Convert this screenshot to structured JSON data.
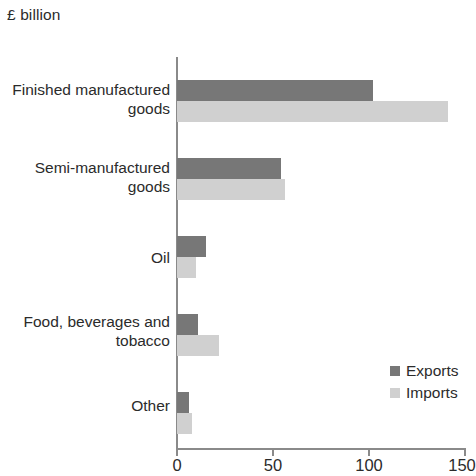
{
  "chart_data": {
    "type": "bar",
    "orientation": "horizontal",
    "title": "£ billion",
    "xlabel": "",
    "ylabel": "",
    "xlim": [
      0,
      150
    ],
    "xticks": [
      0,
      50,
      100,
      150
    ],
    "xtick_labels": [
      "0",
      "50",
      "100",
      "150"
    ],
    "grid": false,
    "legend_position": "inside-right-lower",
    "categories": [
      "Finished manufactured goods",
      "Semi-manufactured goods",
      "Oil",
      "Food, beverages and tobacco",
      "Other"
    ],
    "series": [
      {
        "name": "Exports",
        "color": "#777777",
        "values": [
          102,
          54,
          15,
          11,
          6
        ]
      },
      {
        "name": "Imports",
        "color": "#d0d0d0",
        "values": [
          141,
          56,
          10,
          22,
          8
        ]
      }
    ]
  },
  "axis": {
    "unit_title": "£ billion",
    "ticks": [
      {
        "label": "0",
        "value": 0
      },
      {
        "label": "50",
        "value": 50
      },
      {
        "label": "100",
        "value": 100
      },
      {
        "label": "150",
        "value": 150
      }
    ]
  },
  "categories": [
    {
      "line1": "Finished manufactured",
      "line2": "goods"
    },
    {
      "line1": "Semi-manufactured",
      "line2": "goods"
    },
    {
      "line1": "Oil",
      "line2": ""
    },
    {
      "line1": "Food, beverages and",
      "line2": "tobacco"
    },
    {
      "line1": "Other",
      "line2": ""
    }
  ],
  "legend": {
    "items": [
      {
        "label": "Exports",
        "color": "#777777"
      },
      {
        "label": "Imports",
        "color": "#d0d0d0"
      }
    ]
  }
}
